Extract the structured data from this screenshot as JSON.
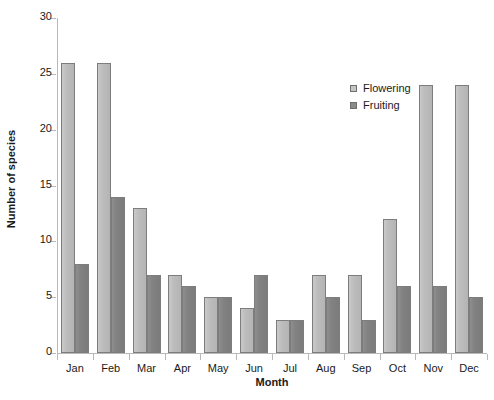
{
  "chart_data": {
    "type": "bar",
    "title": "",
    "xlabel": "Month",
    "ylabel": "Number of species",
    "categories": [
      "Jan",
      "Feb",
      "Mar",
      "Apr",
      "May",
      "Jun",
      "Jul",
      "Aug",
      "Sep",
      "Oct",
      "Nov",
      "Dec"
    ],
    "series": [
      {
        "name": "Flowering",
        "color": "#bdbdbd",
        "values": [
          26,
          26,
          13,
          7,
          5,
          4,
          3,
          7,
          7,
          12,
          24,
          24
        ]
      },
      {
        "name": "Fruiting",
        "color": "#828282",
        "values": [
          8,
          14,
          7,
          6,
          5,
          7,
          3,
          5,
          3,
          6,
          6,
          5
        ]
      }
    ],
    "ylim": [
      0,
      30
    ],
    "yticks": [
      0,
      5,
      10,
      15,
      20,
      25,
      30
    ],
    "ytick_labels": [
      "0",
      "5",
      "10",
      "15",
      "20",
      "25",
      "30"
    ],
    "grid": false,
    "legend_position": "upper right",
    "legend_entries": [
      "Flowering",
      "Fruiting"
    ]
  }
}
